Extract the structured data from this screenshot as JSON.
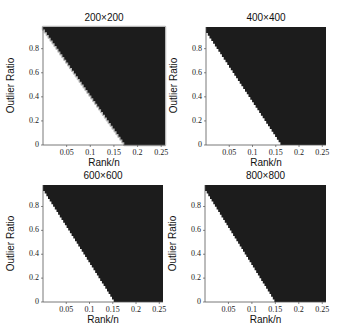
{
  "chart_data": [
    {
      "type": "heatmap",
      "title": "200×200",
      "xlabel": "Rank/n",
      "ylabel": "Outlier Ratio",
      "xlim": [
        0,
        0.258
      ],
      "ylim": [
        0,
        0.98
      ],
      "xticks": [
        "0.05",
        "0.1",
        "0.15",
        "0.2",
        "0.25"
      ],
      "yticks": [
        "0",
        "0.2",
        "0.4",
        "0.6",
        "0.8"
      ],
      "colormap": {
        "success": "#ffffff",
        "failure": "#1c1c1c"
      },
      "boundary": [
        [
          0,
          0.96
        ],
        [
          0.172,
          0
        ]
      ],
      "grid": false
    },
    {
      "type": "heatmap",
      "title": "400×400",
      "xlabel": "Rank/n",
      "ylabel": "Outlier Ratio",
      "xlim": [
        0,
        0.258
      ],
      "ylim": [
        0,
        0.98
      ],
      "xticks": [
        "0.05",
        "0.1",
        "0.15",
        "0.2",
        "0.25"
      ],
      "yticks": [
        "0",
        "0.2",
        "0.4",
        "0.6",
        "0.8"
      ],
      "colormap": {
        "success": "#ffffff",
        "failure": "#1c1c1c"
      },
      "boundary": [
        [
          0,
          0.93
        ],
        [
          0.16,
          0
        ]
      ],
      "grid": false
    },
    {
      "type": "heatmap",
      "title": "600×600",
      "xlabel": "Rank/n",
      "ylabel": "Outlier Ratio",
      "xlim": [
        0,
        0.258
      ],
      "ylim": [
        0,
        0.98
      ],
      "xticks": [
        "0.05",
        "0.1",
        "0.15",
        "0.2",
        "0.25"
      ],
      "yticks": [
        "0",
        "0.2",
        "0.4",
        "0.6",
        "0.8"
      ],
      "colormap": {
        "success": "#ffffff",
        "failure": "#1c1c1c"
      },
      "boundary": [
        [
          0,
          0.93
        ],
        [
          0.152,
          0
        ]
      ],
      "grid": false
    },
    {
      "type": "heatmap",
      "title": "800×800",
      "xlabel": "Rank/n",
      "ylabel": "Outlier Ratio",
      "xlim": [
        0,
        0.258
      ],
      "ylim": [
        0,
        0.98
      ],
      "xticks": [
        "0.05",
        "0.1",
        "0.15",
        "0.2",
        "0.25"
      ],
      "yticks": [
        "0",
        "0.2",
        "0.4",
        "0.6",
        "0.8"
      ],
      "colormap": {
        "success": "#ffffff",
        "failure": "#1c1c1c"
      },
      "boundary": [
        [
          0,
          0.93
        ],
        [
          0.148,
          0
        ]
      ],
      "grid": false
    }
  ],
  "panels": [
    {
      "title": "200×200",
      "xlabel": "Rank/n",
      "ylabel": "Outlier Ratio"
    },
    {
      "title": "400×400",
      "xlabel": "Rank/n",
      "ylabel": "Outlier Ratio"
    },
    {
      "title": "600×600",
      "xlabel": "Rank/n",
      "ylabel": "Outlier Ratio"
    },
    {
      "title": "800×800",
      "xlabel": "Rank/n",
      "ylabel": "Outlier Ratio"
    }
  ],
  "ticks": {
    "x": [
      "0.05",
      "0.1",
      "0.15",
      "0.2",
      "0.25"
    ],
    "y": [
      "0",
      "0.2",
      "0.4",
      "0.6",
      "0.8"
    ]
  }
}
